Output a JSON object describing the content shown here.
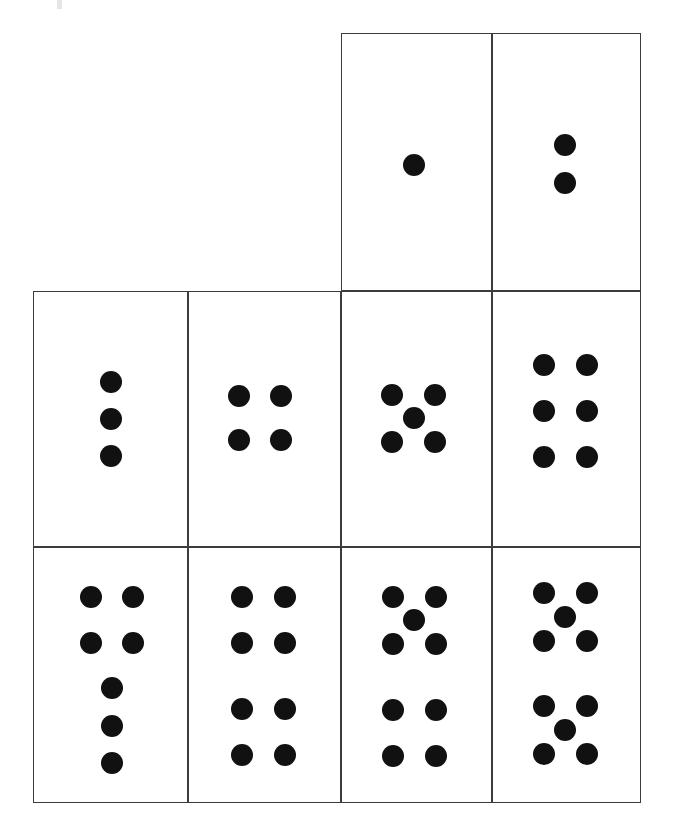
{
  "page": {
    "background_color": "#ffffff",
    "width": 674,
    "height": 836
  },
  "style": {
    "cell_border_color": "#3c3c3c",
    "cell_border_width": 1.6,
    "cell_fill_color": "#ffffff",
    "dot_color": "#111111",
    "dot_diameter": 22
  },
  "grid": {
    "column_edges_px": [
      33,
      188,
      341,
      492,
      641
    ],
    "row_edges_px": [
      33,
      291,
      547,
      803
    ],
    "columns": 4,
    "rows": 3,
    "note": "Row 1 only occupies columns 3 and 4; rows 2 and 3 occupy all four columns."
  },
  "chart_data": {
    "type": "table",
    "categories": [
      "1",
      "2",
      "3",
      "4",
      "5",
      "6",
      "7",
      "8",
      "9",
      "10"
    ],
    "values": [
      1,
      2,
      3,
      4,
      5,
      6,
      7,
      8,
      9,
      10
    ],
    "xlabel": "",
    "ylabel": "",
    "legend": [],
    "grid": true
  },
  "cells": [
    {
      "id": "cell-1",
      "name": "dot-card-1",
      "dot_count": 1,
      "row": 1,
      "column": 3,
      "rect": {
        "x": 341,
        "y": 33,
        "w": 151,
        "h": 258
      },
      "pattern": "single-center",
      "dots": [
        {
          "cx": 415,
          "cy": 166,
          "d": 22
        }
      ]
    },
    {
      "id": "cell-2",
      "name": "dot-card-2",
      "dot_count": 2,
      "row": 1,
      "column": 4,
      "rect": {
        "x": 492,
        "y": 33,
        "w": 149,
        "h": 258
      },
      "pattern": "vertical-pair",
      "dots": [
        {
          "cx": 566,
          "cy": 146,
          "d": 22
        },
        {
          "cx": 566,
          "cy": 184,
          "d": 22
        }
      ]
    },
    {
      "id": "cell-3",
      "name": "dot-card-3",
      "dot_count": 3,
      "row": 2,
      "column": 1,
      "rect": {
        "x": 33,
        "y": 291,
        "w": 155,
        "h": 256
      },
      "pattern": "vertical-triple",
      "dots": [
        {
          "cx": 112,
          "cy": 383,
          "d": 22
        },
        {
          "cx": 112,
          "cy": 420,
          "d": 22
        },
        {
          "cx": 112,
          "cy": 457,
          "d": 22
        }
      ]
    },
    {
      "id": "cell-4",
      "name": "dot-card-4",
      "dot_count": 4,
      "row": 2,
      "column": 2,
      "rect": {
        "x": 188,
        "y": 291,
        "w": 153,
        "h": 256
      },
      "pattern": "square-2x2",
      "dots": [
        {
          "cx": 240,
          "cy": 397,
          "d": 22
        },
        {
          "cx": 282,
          "cy": 397,
          "d": 22
        },
        {
          "cx": 240,
          "cy": 441,
          "d": 22
        },
        {
          "cx": 282,
          "cy": 441,
          "d": 22
        }
      ]
    },
    {
      "id": "cell-5",
      "name": "dot-card-5",
      "dot_count": 5,
      "row": 2,
      "column": 3,
      "rect": {
        "x": 341,
        "y": 291,
        "w": 151,
        "h": 256
      },
      "pattern": "quincunx",
      "dots": [
        {
          "cx": 393,
          "cy": 396,
          "d": 22
        },
        {
          "cx": 436,
          "cy": 396,
          "d": 22
        },
        {
          "cx": 415,
          "cy": 419,
          "d": 22
        },
        {
          "cx": 393,
          "cy": 443,
          "d": 22
        },
        {
          "cx": 436,
          "cy": 443,
          "d": 22
        }
      ]
    },
    {
      "id": "cell-6",
      "name": "dot-card-6",
      "dot_count": 6,
      "row": 2,
      "column": 4,
      "rect": {
        "x": 492,
        "y": 291,
        "w": 149,
        "h": 256
      },
      "pattern": "grid-2x3",
      "dots": [
        {
          "cx": 545,
          "cy": 366,
          "d": 22
        },
        {
          "cx": 588,
          "cy": 366,
          "d": 22
        },
        {
          "cx": 545,
          "cy": 412,
          "d": 22
        },
        {
          "cx": 588,
          "cy": 412,
          "d": 22
        },
        {
          "cx": 545,
          "cy": 458,
          "d": 22
        },
        {
          "cx": 588,
          "cy": 458,
          "d": 22
        }
      ]
    },
    {
      "id": "cell-7",
      "name": "dot-card-7",
      "dot_count": 7,
      "row": 3,
      "column": 1,
      "rect": {
        "x": 33,
        "y": 547,
        "w": 155,
        "h": 256
      },
      "pattern": "pair-pair-vertical-triple",
      "dots": [
        {
          "cx": 92,
          "cy": 598,
          "d": 22
        },
        {
          "cx": 134,
          "cy": 598,
          "d": 22
        },
        {
          "cx": 92,
          "cy": 644,
          "d": 22
        },
        {
          "cx": 134,
          "cy": 644,
          "d": 22
        },
        {
          "cx": 113,
          "cy": 689,
          "d": 22
        },
        {
          "cx": 113,
          "cy": 727,
          "d": 22
        },
        {
          "cx": 113,
          "cy": 764,
          "d": 22
        }
      ]
    },
    {
      "id": "cell-8",
      "name": "dot-card-8",
      "dot_count": 8,
      "row": 3,
      "column": 2,
      "rect": {
        "x": 188,
        "y": 547,
        "w": 153,
        "h": 256
      },
      "pattern": "grid-2x4",
      "dots": [
        {
          "cx": 243,
          "cy": 598,
          "d": 22
        },
        {
          "cx": 286,
          "cy": 598,
          "d": 22
        },
        {
          "cx": 243,
          "cy": 644,
          "d": 22
        },
        {
          "cx": 286,
          "cy": 644,
          "d": 22
        },
        {
          "cx": 243,
          "cy": 710,
          "d": 22
        },
        {
          "cx": 286,
          "cy": 710,
          "d": 22
        },
        {
          "cx": 243,
          "cy": 756,
          "d": 22
        },
        {
          "cx": 286,
          "cy": 756,
          "d": 22
        }
      ]
    },
    {
      "id": "cell-9",
      "name": "dot-card-9",
      "dot_count": 9,
      "row": 3,
      "column": 3,
      "rect": {
        "x": 341,
        "y": 547,
        "w": 151,
        "h": 256
      },
      "pattern": "quincunx-over-square",
      "dots": [
        {
          "cx": 394,
          "cy": 598,
          "d": 22
        },
        {
          "cx": 437,
          "cy": 598,
          "d": 22
        },
        {
          "cx": 415,
          "cy": 621,
          "d": 22
        },
        {
          "cx": 394,
          "cy": 645,
          "d": 22
        },
        {
          "cx": 437,
          "cy": 645,
          "d": 22
        },
        {
          "cx": 394,
          "cy": 711,
          "d": 22
        },
        {
          "cx": 437,
          "cy": 711,
          "d": 22
        },
        {
          "cx": 394,
          "cy": 757,
          "d": 22
        },
        {
          "cx": 437,
          "cy": 757,
          "d": 22
        }
      ]
    },
    {
      "id": "cell-10",
      "name": "dot-card-10",
      "dot_count": 10,
      "row": 3,
      "column": 4,
      "rect": {
        "x": 492,
        "y": 547,
        "w": 149,
        "h": 256
      },
      "pattern": "quincunx-over-quincunx",
      "dots": [
        {
          "cx": 545,
          "cy": 594,
          "d": 22
        },
        {
          "cx": 588,
          "cy": 594,
          "d": 22
        },
        {
          "cx": 566,
          "cy": 618,
          "d": 22
        },
        {
          "cx": 545,
          "cy": 642,
          "d": 22
        },
        {
          "cx": 588,
          "cy": 642,
          "d": 22
        },
        {
          "cx": 545,
          "cy": 707,
          "d": 22
        },
        {
          "cx": 588,
          "cy": 707,
          "d": 22
        },
        {
          "cx": 566,
          "cy": 731,
          "d": 22
        },
        {
          "cx": 545,
          "cy": 755,
          "d": 22
        },
        {
          "cx": 588,
          "cy": 755,
          "d": 22
        }
      ]
    }
  ],
  "artifacts": [
    {
      "name": "scan-speck",
      "x": 57,
      "y": 0,
      "w": 5,
      "h": 9,
      "color": "#cfcfd6"
    }
  ]
}
